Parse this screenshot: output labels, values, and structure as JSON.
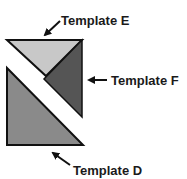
{
  "diagram": {
    "type": "quilt-block-templates",
    "pieces": [
      {
        "id": "E",
        "label": "Template E",
        "color": "#c8c8c8",
        "shape": "triangle"
      },
      {
        "id": "F",
        "label": "Template F",
        "color": "#555555",
        "shape": "triangle"
      },
      {
        "id": "D",
        "label": "Template D",
        "color": "#8a8a8a",
        "shape": "triangle"
      }
    ],
    "outline_color": "#111111"
  },
  "labels": {
    "template_e": "Template E",
    "template_f": "Template F",
    "template_d": "Template D"
  }
}
